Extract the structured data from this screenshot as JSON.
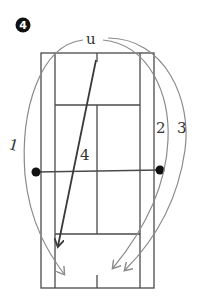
{
  "diagram": {
    "badge": {
      "number": "4",
      "color": "#111111"
    },
    "origin_label": "u",
    "court": {
      "line_color": "#4a4a4a",
      "outer": {
        "x1": 41,
        "y1": 53,
        "x2": 154,
        "y2": 288
      },
      "singles_left_x": 55,
      "singles_right_x": 140,
      "service_line_top_y": 105,
      "service_line_bottom_y": 234,
      "net_y": 171,
      "center_x": 97
    },
    "net_posts": [
      {
        "name": "left-post",
        "x": 36,
        "y": 172
      },
      {
        "name": "right-post",
        "x": 160,
        "y": 170
      }
    ],
    "shots": [
      {
        "id": "1",
        "label": "1",
        "type": "curved",
        "color": "#8a8a8a"
      },
      {
        "id": "2",
        "label": "2",
        "type": "curved",
        "color": "#8a8a8a"
      },
      {
        "id": "3",
        "label": "3",
        "type": "curved",
        "color": "#8a8a8a"
      },
      {
        "id": "4",
        "label": "4",
        "type": "straight",
        "color": "#3a3a3a"
      }
    ]
  }
}
